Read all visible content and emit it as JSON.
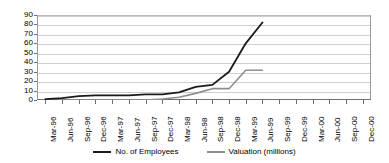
{
  "chart_data": {
    "type": "line",
    "title": "",
    "xlabel": "",
    "ylabel": "",
    "ylim": [
      0,
      90
    ],
    "ytick_step": 10,
    "yticks": [
      "90",
      "80",
      "70",
      "60",
      "50",
      "40",
      "30",
      "20",
      "10",
      "0"
    ],
    "grid": true,
    "legend_position": "bottom",
    "categories": [
      "Mar-96",
      "Jun-96",
      "Sep-96",
      "Dec-96",
      "Mar-97",
      "Jun-97",
      "Sep-97",
      "Dec-97",
      "Mar-98",
      "Jun-98",
      "Sep-98",
      "Dec-98",
      "Mar-99",
      "Jun-99",
      "Sep-99",
      "Dec-99",
      "Mar-00",
      "Jun-00",
      "Sep-00",
      "Dec-00"
    ],
    "series": [
      {
        "name": "No. of Employees",
        "color": "#1a1a1a",
        "values": [
          1,
          2,
          4,
          5,
          5,
          5,
          6,
          6,
          8,
          14,
          16,
          30,
          60,
          82,
          null,
          null,
          null,
          null,
          null,
          null
        ]
      },
      {
        "name": "Valuation (millions)",
        "color": "#8e8e8e",
        "values": [
          0,
          0,
          0,
          0,
          0,
          0,
          0,
          1,
          3,
          7,
          12,
          12,
          31.5,
          31.5,
          null,
          null,
          null,
          null,
          null,
          null
        ]
      }
    ]
  },
  "legend": {
    "items": [
      {
        "label": "No. of Employees"
      },
      {
        "label": "Valuation (millions)"
      }
    ]
  },
  "colors": {
    "employees": "#1a1a1a",
    "valuation": "#8e8e8e",
    "grid": "#cfcfcf",
    "axis": "#6e6e6e"
  }
}
